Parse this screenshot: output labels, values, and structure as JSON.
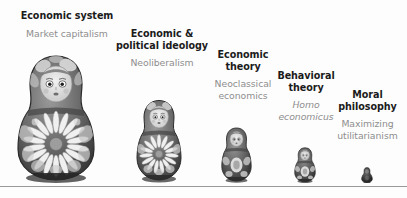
{
  "figure": {
    "background_color": "#fdfdfd",
    "baseline_color": "#9a9a9a",
    "title_color": "#1b1b1b",
    "subtitle_color": "#8e8e8e"
  },
  "nesting_levels": [
    {
      "title": "Economic system",
      "subtitle": "Market capitalism",
      "subtitle_italic": false,
      "doll_size": "largest",
      "doll_order": 1
    },
    {
      "title": "Economic &\npolitical ideology",
      "subtitle": "Neoliberalism",
      "subtitle_italic": false,
      "doll_size": "large",
      "doll_order": 2
    },
    {
      "title": "Economic\ntheory",
      "subtitle": "Neoclassical\neconomics",
      "subtitle_italic": false,
      "doll_size": "medium",
      "doll_order": 3
    },
    {
      "title": "Behavioral\ntheory",
      "subtitle": "Homo\neconomicus",
      "subtitle_italic": true,
      "doll_size": "small",
      "doll_order": 4
    },
    {
      "title": "Moral\nphilosophy",
      "subtitle": "Maximizing\nutilitarianism",
      "subtitle_italic": false,
      "doll_size": "smallest",
      "doll_order": 5
    }
  ]
}
